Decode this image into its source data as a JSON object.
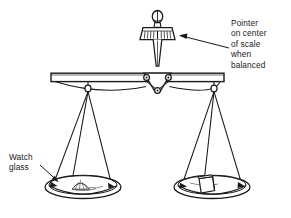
{
  "figure": {
    "ink_color": "#1a1a1a",
    "background_color": "#ffffff"
  },
  "annotations": {
    "pointer_label": {
      "name": "pointer-callout",
      "lines": [
        "Pointer",
        "on center",
        "of scale",
        "when",
        "balanced"
      ],
      "full_text": "Pointer on center of scale when balanced"
    },
    "watch_glass_label": {
      "name": "watch-glass-callout",
      "lines": [
        "Watch",
        "glass"
      ],
      "full_text": "Watch glass"
    }
  },
  "parts": {
    "pointer_knob": "knob",
    "pointer_scale": "graduated-scale",
    "pointer_stem": "pointer-needle",
    "fulcrum": "fulcrum-block",
    "beam": "balance-beam",
    "left_hanger": "left-hanger-ring",
    "right_hanger": "right-hanger-ring",
    "left_pan": "left-watch-glass",
    "right_pan": "right-watch-glass",
    "sample": "powder-sample",
    "weight": "weight-block"
  }
}
